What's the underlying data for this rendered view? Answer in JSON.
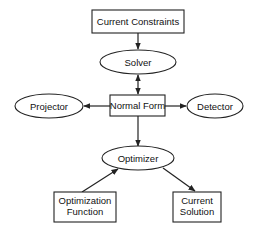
{
  "diagram": {
    "type": "flow",
    "nodes": {
      "current_constraints": {
        "label": "Current Constraints",
        "shape": "rect"
      },
      "solver": {
        "label": "Solver",
        "shape": "ellipse"
      },
      "normal_form": {
        "label": "Normal Form",
        "shape": "rect"
      },
      "projector": {
        "label": "Projector",
        "shape": "ellipse"
      },
      "detector": {
        "label": "Detector",
        "shape": "ellipse"
      },
      "optimizer": {
        "label": "Optimizer",
        "shape": "ellipse"
      },
      "optimization_function": {
        "label_line1": "Optimization",
        "label_line2": "Function",
        "shape": "rect"
      },
      "current_solution": {
        "label_line1": "Current",
        "label_line2": "Solution",
        "shape": "rect"
      }
    },
    "edges": [
      {
        "from": "Current Constraints",
        "to": "Solver",
        "direction": "forward"
      },
      {
        "from": "Solver",
        "to": "Normal Form",
        "direction": "bidirectional"
      },
      {
        "from": "Normal Form",
        "to": "Projector",
        "direction": "forward"
      },
      {
        "from": "Normal Form",
        "to": "Detector",
        "direction": "forward"
      },
      {
        "from": "Normal Form",
        "to": "Optimizer",
        "direction": "forward"
      },
      {
        "from": "Optimization Function",
        "to": "Optimizer",
        "direction": "forward"
      },
      {
        "from": "Optimizer",
        "to": "Current Solution",
        "direction": "forward"
      }
    ]
  }
}
